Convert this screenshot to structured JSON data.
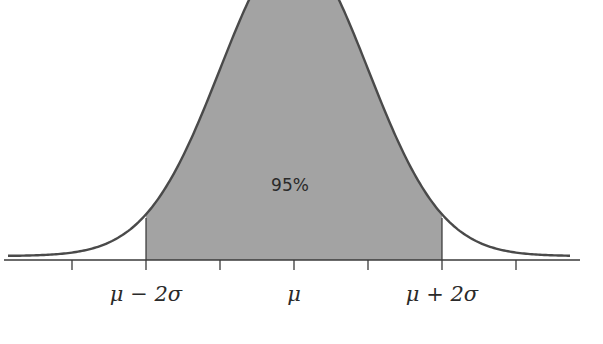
{
  "chart_data": {
    "type": "area",
    "title": "",
    "xlabel": "",
    "ylabel": "",
    "x_ticks": [
      -3,
      -2,
      -1,
      0,
      1,
      2,
      3
    ],
    "tick_labels": [
      {
        "x": -2,
        "label": "μ − 2σ"
      },
      {
        "x": 0,
        "label": "μ"
      },
      {
        "x": 2,
        "label": "μ + 2σ"
      }
    ],
    "shaded_region": {
      "from": -2,
      "to": 2,
      "label": "95%"
    },
    "grid": false,
    "legend": null
  },
  "colors": {
    "shade": "#a3a3a3",
    "line": "#4a4a4a",
    "axis": "#3a3a3a"
  },
  "labels": {
    "mu_minus_2sigma": "μ − 2σ",
    "mu": "μ",
    "mu_plus_2sigma": "μ + 2σ",
    "percent": "95%"
  }
}
